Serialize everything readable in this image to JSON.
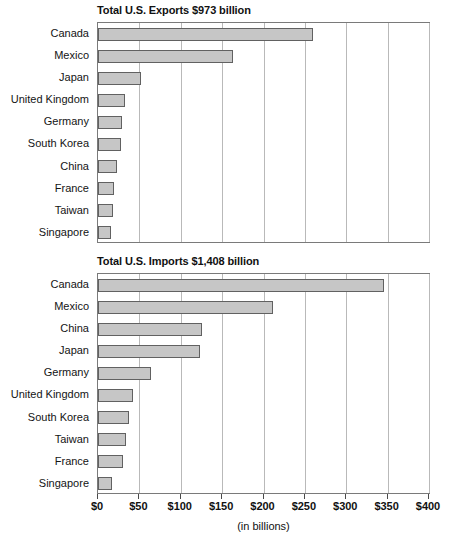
{
  "figure": {
    "axis_caption": "(in billions)"
  },
  "chart_data": [
    {
      "type": "bar",
      "orientation": "horizontal",
      "title": "Total U.S. Exports $973 billion",
      "total": 973,
      "xlabel": "(in billions)",
      "ylabel": "",
      "xlim": [
        0,
        400
      ],
      "xticks": [
        0,
        50,
        100,
        150,
        200,
        250,
        300,
        350,
        400
      ],
      "xticklabels": [
        "$0",
        "$50",
        "$100",
        "$150",
        "$200",
        "$250",
        "$300",
        "$350",
        "$400"
      ],
      "grid": true,
      "legend": null,
      "categories": [
        "Canada",
        "Mexico",
        "Japan",
        "United Kingdom",
        "Germany",
        "South Korea",
        "China",
        "France",
        "Taiwan",
        "Singapore"
      ],
      "values": [
        260,
        163,
        52,
        33,
        29,
        28,
        23,
        19,
        18,
        16
      ],
      "bar_color": "#c6c6c6",
      "bar_edge_color": "#616161"
    },
    {
      "type": "bar",
      "orientation": "horizontal",
      "title": "Total U.S. Imports $1,408 billion",
      "total": 1408,
      "xlabel": "(in billions)",
      "ylabel": "",
      "xlim": [
        0,
        400
      ],
      "xticks": [
        0,
        50,
        100,
        150,
        200,
        250,
        300,
        350,
        400
      ],
      "xticklabels": [
        "$0",
        "$50",
        "$100",
        "$150",
        "$200",
        "$250",
        "$300",
        "$350",
        "$400"
      ],
      "grid": true,
      "legend": null,
      "categories": [
        "Canada",
        "Mexico",
        "China",
        "Japan",
        "Germany",
        "United Kingdom",
        "South Korea",
        "Taiwan",
        "France",
        "Singapore"
      ],
      "values": [
        346,
        211,
        126,
        123,
        64,
        42,
        37,
        34,
        30,
        17
      ],
      "bar_color": "#c6c6c6",
      "bar_edge_color": "#616161"
    }
  ]
}
